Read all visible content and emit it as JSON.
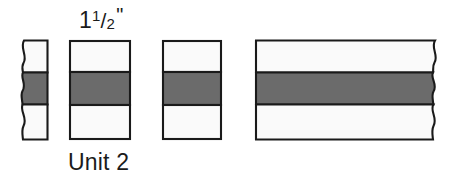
{
  "figure": {
    "name": "fraction-strips-diagram",
    "background_color": "#ffffff",
    "labels": {
      "top_measure": {
        "full_text": "1 1/2\"",
        "whole": "1",
        "fraction_numerator": "1",
        "fraction_slash": "/",
        "fraction_denominator": "2",
        "inch_mark": "\""
      },
      "bottom_unit": "Unit 2"
    },
    "colors": {
      "band_gray": "#6b6b6b",
      "strip_white": "#fafafa",
      "outline_black": "#1a1a1a",
      "text_black": "#1b1b1b"
    },
    "bars": [
      {
        "id": "bar-1",
        "label": "strip-narrow-torn-left",
        "x": 20,
        "y": 40,
        "width": 28,
        "height": 100,
        "band_top": 72,
        "band_height": 33,
        "left_edge": "wavy",
        "right_edge": "straight"
      },
      {
        "id": "bar-2",
        "label": "strip-unit-2",
        "x": 69,
        "y": 40,
        "width": 62,
        "height": 100,
        "band_top": 72,
        "band_height": 33,
        "left_edge": "straight",
        "right_edge": "straight"
      },
      {
        "id": "bar-3",
        "label": "strip-medium",
        "x": 162,
        "y": 40,
        "width": 60,
        "height": 100,
        "band_top": 72,
        "band_height": 33,
        "left_edge": "straight",
        "right_edge": "straight"
      },
      {
        "id": "bar-4",
        "label": "strip-wide-torn-right",
        "x": 255,
        "y": 40,
        "width": 185,
        "height": 100,
        "band_top": 72,
        "band_height": 33,
        "left_edge": "straight",
        "right_edge": "wavy"
      }
    ]
  }
}
